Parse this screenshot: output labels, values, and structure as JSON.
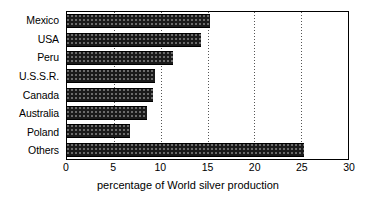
{
  "chart_data": {
    "type": "bar",
    "orientation": "horizontal",
    "title": "",
    "xlabel": "percentage of World silver production",
    "ylabel": "",
    "categories": [
      "Mexico",
      "USA",
      "Peru",
      "U.S.S.R.",
      "Canada",
      "Australia",
      "Poland",
      "Others"
    ],
    "values": [
      15.3,
      14.3,
      11.3,
      9.4,
      9.2,
      8.5,
      6.7,
      25.3
    ],
    "xlim": [
      0,
      30
    ],
    "xticks": [
      0,
      5,
      10,
      15,
      20,
      25,
      30
    ],
    "xticklabels": [
      "0",
      "5",
      "10",
      "15",
      "20",
      "25",
      "30"
    ],
    "grid": "vertical-dotted",
    "legend": "none",
    "bar_color": "#1a1a1a",
    "bar_pattern": "dithered-speckle",
    "frame_color": "#000000"
  }
}
